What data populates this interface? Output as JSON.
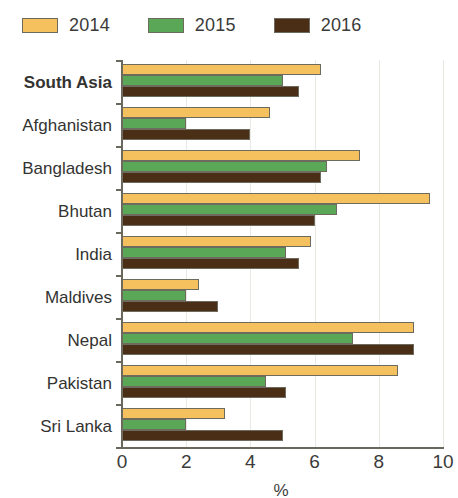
{
  "legend": {
    "position": "top-left",
    "items": [
      {
        "label": "2014",
        "color": "#f5c05e"
      },
      {
        "label": "2015",
        "color": "#5ba758"
      },
      {
        "label": "2016",
        "color": "#4a2f16"
      }
    ]
  },
  "axis": {
    "x_title": "%",
    "x_ticks": [
      "0",
      "2",
      "4",
      "6",
      "8",
      "10"
    ],
    "x_tick_values": [
      0,
      2,
      4,
      6,
      8,
      10
    ]
  },
  "chart_data": {
    "type": "bar",
    "orientation": "horizontal",
    "title": "",
    "subtitle": "",
    "xlabel": "%",
    "ylabel": "",
    "xlim": [
      0,
      10
    ],
    "grid": true,
    "legend_position": "top-left",
    "categories": [
      "South Asia",
      "Afghanistan",
      "Bangladesh",
      "Bhutan",
      "India",
      "Maldives",
      "Nepal",
      "Pakistan",
      "Sri Lanka"
    ],
    "emphasized_categories": [
      "South Asia"
    ],
    "series": [
      {
        "name": "2014",
        "color": "#f5c05e",
        "values": [
          6.2,
          4.6,
          7.4,
          9.6,
          5.9,
          2.4,
          9.1,
          8.6,
          3.2
        ]
      },
      {
        "name": "2015",
        "color": "#5ba758",
        "values": [
          5.0,
          2.0,
          6.4,
          6.7,
          5.1,
          2.0,
          7.2,
          4.5,
          2.0
        ]
      },
      {
        "name": "2016",
        "color": "#4a2f16",
        "values": [
          5.5,
          4.0,
          6.2,
          6.0,
          5.5,
          3.0,
          9.1,
          5.1,
          5.0
        ]
      }
    ]
  }
}
